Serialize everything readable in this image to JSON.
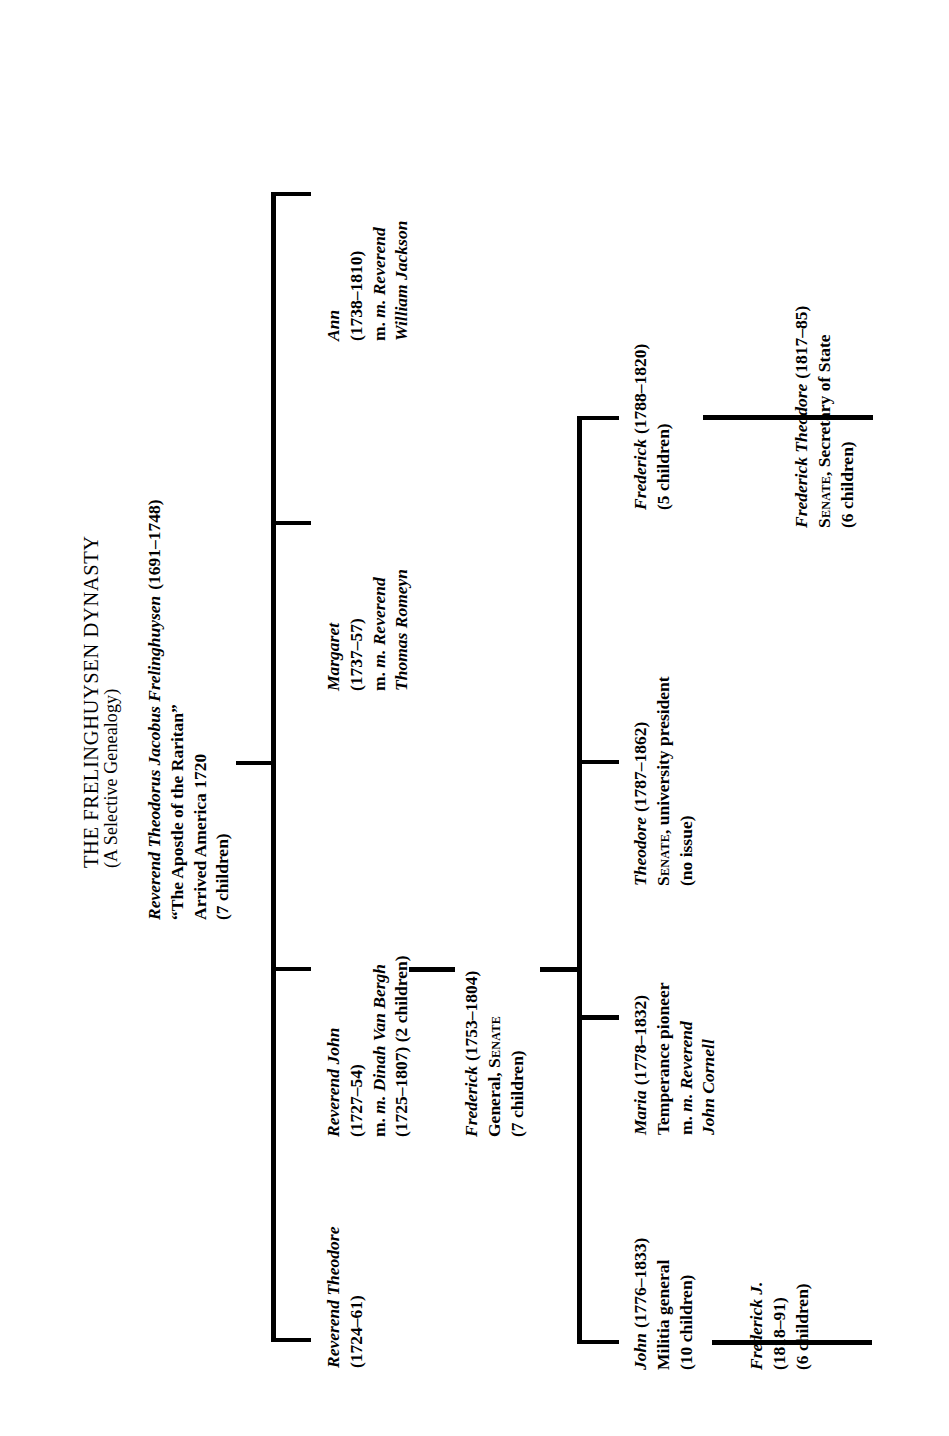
{
  "title": {
    "line1": "THE FRELINGHUYSEN DYNASTY",
    "line2": "(A Selective Genealogy)"
  },
  "root": {
    "name": "Reverend Theodorus Jacobus Frelinghuysen",
    "dates": "(1691–1748)",
    "epithet": "“The Apostle of the Raritan”",
    "arrival": "Arrived America  1720",
    "children_count": "(7 children)"
  },
  "generation2": [
    {
      "name": "Reverend Theodore",
      "dates": "(1724–61)",
      "lines": []
    },
    {
      "name": "Reverend John",
      "dates": "(1727–54)",
      "lines": [
        "m. Dinah Van Bergh",
        "(1725–1807)  (2 children)"
      ]
    },
    {
      "name": "Margaret",
      "dates": "(1737–57)",
      "lines": [
        "m. Reverend",
        "Thomas Romeyn"
      ]
    },
    {
      "name": "Ann",
      "dates": "(1738–1810)",
      "lines": [
        "m. Reverend",
        "William Jackson"
      ]
    }
  ],
  "generation3": {
    "name": "Frederick",
    "dates": "(1753–1804)",
    "role_plain": "General, ",
    "role_smallcaps": "Senate",
    "children_count": "(7 children)"
  },
  "generation4": [
    {
      "name": "John",
      "dates": "(1776–1833)",
      "role": "Militia general",
      "children_count": "(10 children)"
    },
    {
      "name": "Maria",
      "dates": "(1778–1832)",
      "role": "Temperance pioneer",
      "spouse_line1": "m. Reverend",
      "spouse_line2": "John Cornell"
    },
    {
      "name": "Theodore",
      "dates": "(1787–1862)",
      "role_smallcaps": "Senate",
      "role_plain": ", university president",
      "children_count": "(no issue)"
    },
    {
      "name": "Frederick",
      "dates": "(1788–1820)",
      "children_count": "(5 children)"
    }
  ],
  "generation5": [
    {
      "name": "Frederick J.",
      "dates": "(1818–91)",
      "children_count": "(6 children)"
    },
    {
      "name": "Frederick Theodore",
      "dates": "(1817–85)",
      "role_smallcaps": "Senate",
      "role_plain": ", Secretary of State",
      "children_count": "(6 children)"
    }
  ],
  "colors": {
    "ink": "#000000",
    "paper": "#ffffff"
  }
}
